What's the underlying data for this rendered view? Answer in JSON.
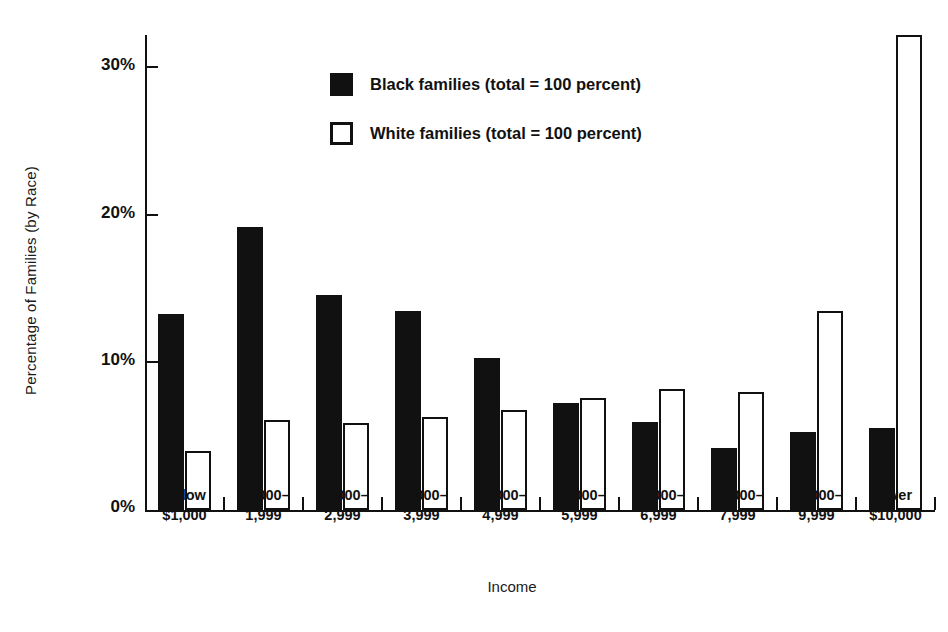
{
  "chart_data": {
    "type": "bar",
    "title": "",
    "xlabel": "Income",
    "ylabel": "Percentage of Families (by Race)",
    "ylim": [
      0,
      33
    ],
    "yticks": [
      "0%",
      "10%",
      "20%",
      "30%"
    ],
    "ytick_values": [
      0,
      10,
      20,
      30
    ],
    "grid": false,
    "legend_position": "upper-center",
    "categories": [
      "Below $1,000",
      "$1,000-1,999",
      "$2,000-2,999",
      "$3,000-3,999",
      "$4,000-4,999",
      "$5,000-5,999",
      "$6,000-6,999",
      "$7,000-7,999",
      "$8,000-9,999",
      "Over $10,000"
    ],
    "category_lines": [
      {
        "line1": "Below",
        "line2": "$1,000"
      },
      {
        "line1": "$1,000–",
        "line2": "1,999"
      },
      {
        "line1": "$2,000–",
        "line2": "2,999"
      },
      {
        "line1": "$3,000–",
        "line2": "3,999"
      },
      {
        "line1": "$4,000–",
        "line2": "4,999"
      },
      {
        "line1": "$5,000–",
        "line2": "5,999"
      },
      {
        "line1": "$6,000–",
        "line2": "6,999"
      },
      {
        "line1": "$7,000–",
        "line2": "7,999"
      },
      {
        "line1": "$8,000–",
        "line2": "9,999"
      },
      {
        "line1": "Over",
        "line2": "$10,000"
      }
    ],
    "series": [
      {
        "name": "Black families (total = 100 percent)",
        "color": "#111111",
        "style": "filled",
        "values": [
          13.3,
          19.2,
          14.6,
          13.5,
          10.3,
          7.3,
          6.0,
          4.2,
          5.3,
          5.6
        ]
      },
      {
        "name": "White families (total = 100 percent)",
        "color": "#ffffff",
        "style": "outlined",
        "values": [
          4.0,
          6.1,
          5.9,
          6.3,
          6.8,
          7.6,
          8.2,
          8.0,
          13.5,
          32.3
        ]
      }
    ]
  },
  "legend": {
    "items": [
      {
        "label": "Black families (total = 100 percent)",
        "swatch": "black"
      },
      {
        "label": "White families (total = 100 percent)",
        "swatch": "white"
      }
    ]
  },
  "axes": {
    "y_title": "Percentage of Families (by Race)",
    "x_title": "Income"
  },
  "colors": {
    "ink": "#111111",
    "background": "#ffffff"
  }
}
